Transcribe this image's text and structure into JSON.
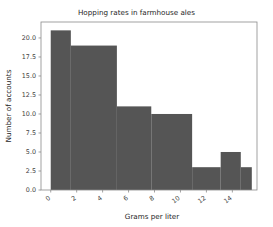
{
  "chart_data": {
    "type": "bar",
    "title": "Hopping rates in farmhouse ales",
    "xlabel": "Grams per liter",
    "ylabel": "Number of accounts",
    "grid": false,
    "legend": null,
    "xlim": [
      -0.75,
      15.9
    ],
    "ylim": [
      0,
      22.1
    ],
    "xticks": [
      0,
      2,
      4,
      6,
      8,
      10,
      12,
      14
    ],
    "xtick_labels": [
      "0",
      "2",
      "4",
      "6",
      "8",
      "10",
      "12",
      "14"
    ],
    "yticks": [
      0.0,
      2.5,
      5.0,
      7.5,
      10.0,
      12.5,
      15.0,
      17.5,
      20.0
    ],
    "ytick_labels": [
      "0.0",
      "2.5",
      "5.0",
      "7.5",
      "10.0",
      "12.5",
      "15.0",
      "17.5",
      "20.0"
    ],
    "bar_color": "#555555",
    "bin_edges": [
      0.0,
      1.55,
      5.1,
      7.75,
      10.9,
      13.1,
      14.65,
      15.5
    ],
    "values": [
      21,
      19,
      11,
      10,
      3,
      5,
      3
    ],
    "bins": [
      {
        "x0": 0.0,
        "x1": 1.55,
        "count": 21
      },
      {
        "x0": 1.55,
        "x1": 5.1,
        "count": 19
      },
      {
        "x0": 5.1,
        "x1": 7.75,
        "count": 11
      },
      {
        "x0": 7.75,
        "x1": 10.9,
        "count": 10
      },
      {
        "x0": 10.9,
        "x1": 13.1,
        "count": 3
      },
      {
        "x0": 13.1,
        "x1": 14.65,
        "count": 5
      },
      {
        "x0": 14.65,
        "x1": 15.5,
        "count": 3
      }
    ]
  }
}
